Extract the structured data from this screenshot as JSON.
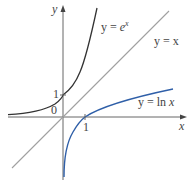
{
  "diagram": {
    "axes": {
      "x_label": "x",
      "y_label": "y",
      "origin_label": "0",
      "x_tick": "1",
      "y_tick": "1"
    },
    "curves": [
      {
        "name": "exp",
        "label_prefix": "y = ",
        "label_func": "e",
        "label_sup": "x",
        "color": "#333333"
      },
      {
        "name": "identity",
        "label": "y = x",
        "color": "#999999"
      },
      {
        "name": "ln",
        "label_prefix": "y = ln ",
        "label_var": "x",
        "color": "#2f5fa8"
      }
    ]
  }
}
